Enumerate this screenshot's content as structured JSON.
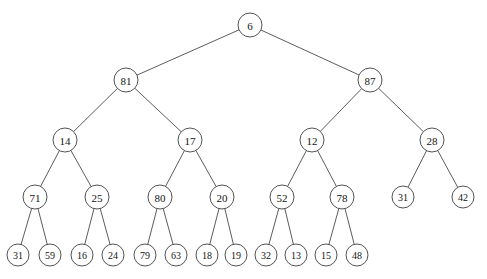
{
  "diagram": {
    "type": "binary-tree",
    "background_color": "#ffffff",
    "node_fill_color": "#ffffff",
    "node_stroke_color": "#3f3f3f",
    "edge_color": "#4a4a4a",
    "label_color": "#141414",
    "node_radius": 12,
    "leaf_radius": 11,
    "depth": 5,
    "node_count": 31,
    "nodes": [
      {
        "id": "n0",
        "label": "6",
        "x": 250,
        "y": 25,
        "r": 12,
        "level": 0,
        "parent": null
      },
      {
        "id": "n1",
        "label": "81",
        "x": 126,
        "y": 80,
        "r": 12,
        "level": 1,
        "parent": "n0"
      },
      {
        "id": "n2",
        "label": "87",
        "x": 370,
        "y": 80,
        "r": 12,
        "level": 1,
        "parent": "n0"
      },
      {
        "id": "n3",
        "label": "14",
        "x": 65,
        "y": 140,
        "r": 12,
        "level": 2,
        "parent": "n1"
      },
      {
        "id": "n4",
        "label": "17",
        "x": 190,
        "y": 140,
        "r": 12,
        "level": 2,
        "parent": "n1"
      },
      {
        "id": "n5",
        "label": "12",
        "x": 312,
        "y": 140,
        "r": 12,
        "level": 2,
        "parent": "n2"
      },
      {
        "id": "n6",
        "label": "28",
        "x": 432,
        "y": 140,
        "r": 12,
        "level": 2,
        "parent": "n2"
      },
      {
        "id": "n7",
        "label": "71",
        "x": 35,
        "y": 197,
        "r": 12,
        "level": 3,
        "parent": "n3"
      },
      {
        "id": "n8",
        "label": "25",
        "x": 97,
        "y": 197,
        "r": 12,
        "level": 3,
        "parent": "n3"
      },
      {
        "id": "n9",
        "label": "80",
        "x": 160,
        "y": 197,
        "r": 12,
        "level": 3,
        "parent": "n4"
      },
      {
        "id": "n10",
        "label": "20",
        "x": 222,
        "y": 197,
        "r": 12,
        "level": 3,
        "parent": "n4"
      },
      {
        "id": "n11",
        "label": "52",
        "x": 282,
        "y": 197,
        "r": 12,
        "level": 3,
        "parent": "n5"
      },
      {
        "id": "n12",
        "label": "78",
        "x": 342,
        "y": 197,
        "r": 12,
        "level": 3,
        "parent": "n5"
      },
      {
        "id": "n13",
        "label": "31",
        "x": 403,
        "y": 197,
        "r": 11,
        "level": 3,
        "parent": "n6"
      },
      {
        "id": "n14",
        "label": "42",
        "x": 463,
        "y": 197,
        "r": 11,
        "level": 3,
        "parent": "n6"
      },
      {
        "id": "n15",
        "label": "31",
        "x": 18,
        "y": 255,
        "r": 11,
        "level": 4,
        "parent": "n7"
      },
      {
        "id": "n16",
        "label": "59",
        "x": 50,
        "y": 255,
        "r": 11,
        "level": 4,
        "parent": "n7"
      },
      {
        "id": "n17",
        "label": "16",
        "x": 82,
        "y": 255,
        "r": 11,
        "level": 4,
        "parent": "n8"
      },
      {
        "id": "n18",
        "label": "24",
        "x": 113,
        "y": 255,
        "r": 11,
        "level": 4,
        "parent": "n8"
      },
      {
        "id": "n19",
        "label": "79",
        "x": 145,
        "y": 255,
        "r": 11,
        "level": 4,
        "parent": "n9"
      },
      {
        "id": "n20",
        "label": "63",
        "x": 176,
        "y": 255,
        "r": 11,
        "level": 4,
        "parent": "n9"
      },
      {
        "id": "n21",
        "label": "18",
        "x": 207,
        "y": 255,
        "r": 11,
        "level": 4,
        "parent": "n10"
      },
      {
        "id": "n22",
        "label": "19",
        "x": 236,
        "y": 255,
        "r": 11,
        "level": 4,
        "parent": "n10"
      },
      {
        "id": "n23",
        "label": "32",
        "x": 266,
        "y": 255,
        "r": 11,
        "level": 4,
        "parent": "n11"
      },
      {
        "id": "n24",
        "label": "13",
        "x": 296,
        "y": 255,
        "r": 11,
        "level": 4,
        "parent": "n11"
      },
      {
        "id": "n25",
        "label": "15",
        "x": 326,
        "y": 255,
        "r": 11,
        "level": 4,
        "parent": "n12"
      },
      {
        "id": "n26",
        "label": "48",
        "x": 357,
        "y": 255,
        "r": 11,
        "level": 4,
        "parent": "n12"
      }
    ],
    "edges": [
      {
        "from": "n0",
        "to": "n1"
      },
      {
        "from": "n0",
        "to": "n2"
      },
      {
        "from": "n1",
        "to": "n3"
      },
      {
        "from": "n1",
        "to": "n4"
      },
      {
        "from": "n2",
        "to": "n5"
      },
      {
        "from": "n2",
        "to": "n6"
      },
      {
        "from": "n3",
        "to": "n7"
      },
      {
        "from": "n3",
        "to": "n8"
      },
      {
        "from": "n4",
        "to": "n9"
      },
      {
        "from": "n4",
        "to": "n10"
      },
      {
        "from": "n5",
        "to": "n11"
      },
      {
        "from": "n5",
        "to": "n12"
      },
      {
        "from": "n6",
        "to": "n13"
      },
      {
        "from": "n6",
        "to": "n14"
      },
      {
        "from": "n7",
        "to": "n15"
      },
      {
        "from": "n7",
        "to": "n16"
      },
      {
        "from": "n8",
        "to": "n17"
      },
      {
        "from": "n8",
        "to": "n18"
      },
      {
        "from": "n9",
        "to": "n19"
      },
      {
        "from": "n9",
        "to": "n20"
      },
      {
        "from": "n10",
        "to": "n21"
      },
      {
        "from": "n10",
        "to": "n22"
      },
      {
        "from": "n11",
        "to": "n23"
      },
      {
        "from": "n11",
        "to": "n24"
      },
      {
        "from": "n12",
        "to": "n25"
      },
      {
        "from": "n12",
        "to": "n26"
      }
    ]
  }
}
